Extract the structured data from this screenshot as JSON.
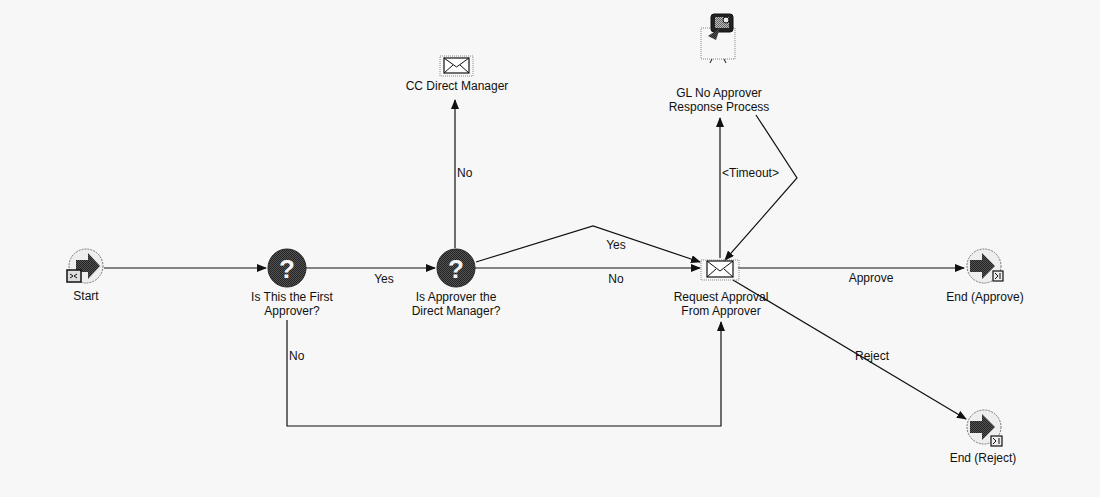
{
  "diagram": {
    "type": "workflow-process",
    "nodes": [
      {
        "id": "start",
        "label": "Start",
        "kind": "start"
      },
      {
        "id": "first_approver",
        "label_line1": "Is This the First",
        "label_line2": "Approver?",
        "kind": "decision"
      },
      {
        "id": "direct_manager",
        "label_line1": "Is Approver the",
        "label_line2": "Direct Manager?",
        "kind": "decision"
      },
      {
        "id": "cc_manager",
        "label": "CC Direct Manager",
        "kind": "notification"
      },
      {
        "id": "gl_no_approver",
        "label_line1": "GL No Approver",
        "label_line2": "Response Process",
        "kind": "subprocess"
      },
      {
        "id": "request_approval",
        "label_line1": "Request Approval",
        "label_line2": "From Approver",
        "kind": "notification"
      },
      {
        "id": "end_approve",
        "label": "End (Approve)",
        "kind": "end"
      },
      {
        "id": "end_reject",
        "label": "End (Reject)",
        "kind": "end"
      }
    ],
    "edges": [
      {
        "from": "start",
        "to": "first_approver",
        "label": ""
      },
      {
        "from": "first_approver",
        "to": "direct_manager",
        "label": "Yes"
      },
      {
        "from": "first_approver",
        "to": "request_approval",
        "label": "No"
      },
      {
        "from": "direct_manager",
        "to": "cc_manager",
        "label": "No"
      },
      {
        "from": "direct_manager",
        "to": "request_approval",
        "label": "No",
        "label_id": "no2"
      },
      {
        "from": "direct_manager",
        "to": "request_approval",
        "label": "Yes",
        "label_id": "yes2"
      },
      {
        "from": "request_approval",
        "to": "gl_no_approver",
        "label": "<Timeout>"
      },
      {
        "from": "gl_no_approver",
        "to": "request_approval",
        "label": ""
      },
      {
        "from": "request_approval",
        "to": "end_approve",
        "label": "Approve"
      },
      {
        "from": "request_approval",
        "to": "end_reject",
        "label": "Reject"
      }
    ]
  },
  "labels": {
    "start": "Start",
    "first_approver_1": "Is This the First",
    "first_approver_2": "Approver?",
    "direct_manager_1": "Is Approver the",
    "direct_manager_2": "Direct Manager?",
    "cc_manager": "CC Direct Manager",
    "gl_1": "GL No Approver",
    "gl_2": "Response Process",
    "request_1": "Request Approval",
    "request_2": "From Approver",
    "end_approve": "End (Approve)",
    "end_reject": "End (Reject)"
  },
  "edge_labels": {
    "yes1": "Yes",
    "no_loop": "No",
    "no_cc": "No",
    "yes2": "Yes",
    "no2": "No",
    "timeout": "<Timeout>",
    "approve": "Approve",
    "reject": "Reject"
  },
  "colors": {
    "background": "#f7f7f7",
    "line": "#111111",
    "icon_dark": "#3a3a3a"
  }
}
